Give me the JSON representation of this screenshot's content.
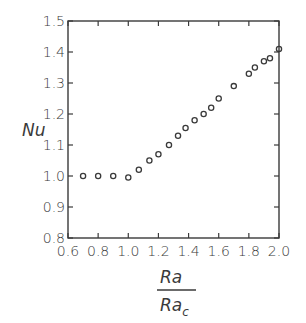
{
  "chart_data": {
    "type": "scatter",
    "title": "",
    "xlabel": "Ra / Ra_c",
    "xlabel_numerator": "Ra",
    "xlabel_denominator": "Ra",
    "xlabel_denominator_sub": "c",
    "ylabel": "Nu",
    "xlim": [
      0.6,
      2.0
    ],
    "ylim": [
      0.8,
      1.5
    ],
    "xticks": [
      "0.6",
      "0.8",
      "1.0",
      "1.2",
      "1.4",
      "1.6",
      "1.8",
      "2.0"
    ],
    "yticks": [
      "0.8",
      "0.9",
      "1.0",
      "1.1",
      "1.2",
      "1.3",
      "1.4",
      "1.5"
    ],
    "grid": false,
    "legend": null,
    "marker": "open-circle",
    "series": [
      {
        "name": "Nu",
        "x": [
          0.7,
          0.8,
          0.9,
          1.0,
          1.07,
          1.14,
          1.2,
          1.27,
          1.33,
          1.38,
          1.44,
          1.5,
          1.55,
          1.6,
          1.7,
          1.8,
          1.84,
          1.9,
          1.94,
          2.0
        ],
        "y": [
          1.0,
          1.0,
          1.0,
          0.995,
          1.02,
          1.05,
          1.07,
          1.1,
          1.13,
          1.155,
          1.18,
          1.2,
          1.22,
          1.25,
          1.29,
          1.33,
          1.35,
          1.37,
          1.38,
          1.41
        ]
      }
    ]
  }
}
